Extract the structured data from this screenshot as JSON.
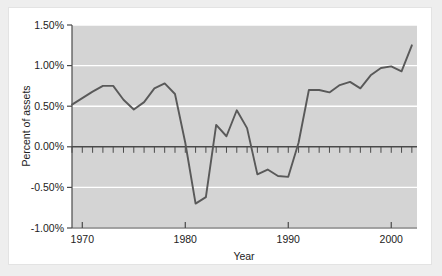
{
  "figure": {
    "background_color": "#eeeeee",
    "panel_color": "#ffffff"
  },
  "chart_data": {
    "type": "line",
    "title": "",
    "subtitle": "",
    "xlabel": "Year",
    "ylabel": "Percent of assets",
    "xlim": [
      1969,
      2002.5
    ],
    "ylim": [
      -1.0,
      1.5
    ],
    "grid": true,
    "grid_color": "#ffffff",
    "plot_background": "#d4d4d4",
    "line_color": "#595959",
    "zero_line_color": "#4a4a4a",
    "legend": null,
    "legend_position": "none",
    "x_tick_labels": [
      "1970",
      "1980",
      "1990",
      "2000"
    ],
    "x_ticks": [
      1970,
      1980,
      1990,
      2000
    ],
    "x_minor_tick_interval": 1,
    "y_tick_labels": [
      "1.50%",
      "1.00%",
      "0.50%",
      "0.00%",
      "-0.50%",
      "-1.00%"
    ],
    "y_ticks": [
      1.5,
      1.0,
      0.5,
      0.0,
      -0.5,
      -1.0
    ],
    "series": [
      {
        "name": "Percent of assets",
        "x": [
          1969,
          1970,
          1971,
          1972,
          1973,
          1974,
          1975,
          1976,
          1977,
          1978,
          1979,
          1980,
          1981,
          1982,
          1983,
          1984,
          1985,
          1986,
          1987,
          1988,
          1989,
          1990,
          1991,
          1992,
          1993,
          1994,
          1995,
          1996,
          1997,
          1998,
          1999,
          2000,
          2001,
          2002
        ],
        "values": [
          0.52,
          0.6,
          0.68,
          0.75,
          0.75,
          0.58,
          0.46,
          0.55,
          0.72,
          0.78,
          0.65,
          0.05,
          -0.7,
          -0.62,
          0.27,
          0.13,
          0.45,
          0.23,
          -0.34,
          -0.28,
          -0.36,
          -0.37,
          0.05,
          0.7,
          0.7,
          0.67,
          0.76,
          0.8,
          0.72,
          0.88,
          0.97,
          0.99,
          0.93,
          1.25
        ]
      }
    ]
  }
}
